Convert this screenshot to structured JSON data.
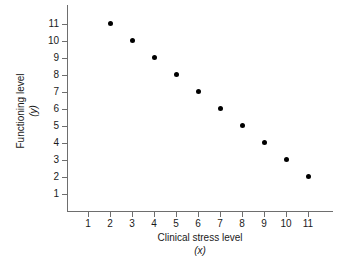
{
  "chart_data": {
    "type": "scatter",
    "title": "",
    "xlabel": "Clinical stress level",
    "xlabel_var": "(x)",
    "ylabel": "Functioning level",
    "ylabel_var": "(y)",
    "x": [
      2,
      3,
      4,
      5,
      6,
      7,
      8,
      9,
      10,
      11
    ],
    "y": [
      11,
      10,
      9,
      8,
      7,
      6,
      5,
      4,
      3,
      2
    ],
    "points": [
      {
        "x": 2,
        "y": 11
      },
      {
        "x": 3,
        "y": 10
      },
      {
        "x": 4,
        "y": 9
      },
      {
        "x": 5,
        "y": 8
      },
      {
        "x": 6,
        "y": 7
      },
      {
        "x": 7,
        "y": 6
      },
      {
        "x": 8,
        "y": 5
      },
      {
        "x": 9,
        "y": 4
      },
      {
        "x": 10,
        "y": 3
      },
      {
        "x": 11,
        "y": 2
      }
    ],
    "xticks": [
      1,
      2,
      3,
      4,
      5,
      6,
      7,
      8,
      9,
      10,
      11
    ],
    "yticks": [
      1,
      2,
      3,
      4,
      5,
      6,
      7,
      8,
      9,
      10,
      11
    ],
    "xlim": [
      0.2,
      12.0
    ],
    "ylim": [
      0.0,
      11.9
    ],
    "grid": false,
    "legend": false,
    "marker_color": "#000000",
    "axis_color": "#6e6e6e",
    "background_color": "#ffffff"
  }
}
